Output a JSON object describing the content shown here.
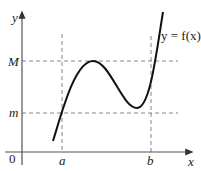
{
  "diagram": {
    "type": "function-graph",
    "axes": {
      "x_label": "x",
      "y_label": "y",
      "origin_label": "0"
    },
    "x_marks": [
      {
        "label": "a"
      },
      {
        "label": "b"
      }
    ],
    "y_marks": [
      {
        "label": "M"
      },
      {
        "label": "m"
      }
    ],
    "curve_label": "y = f(x)",
    "colors": {
      "curve": "#111111",
      "axes": "#555555",
      "guides": "#777777"
    }
  }
}
